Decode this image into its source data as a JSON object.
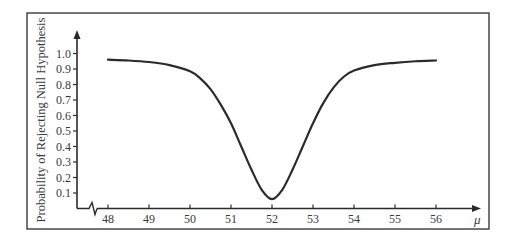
{
  "chart_data": {
    "type": "line",
    "title": "",
    "xlabel": "μ",
    "ylabel": "Probability of Rejecting Null Hypothesis",
    "x_ticks": [
      48,
      49,
      50,
      51,
      52,
      53,
      54,
      55,
      56
    ],
    "y_ticks": [
      0.1,
      0.2,
      0.3,
      0.4,
      0.5,
      0.6,
      0.7,
      0.8,
      0.9,
      1.0
    ],
    "y_tick_labels": [
      "0.1",
      "0.2",
      "0.3",
      "0.4",
      "0.5",
      "0.6",
      "0.7",
      "0.8",
      "0.9",
      "1.0"
    ],
    "x_tick_labels": [
      "48",
      "49",
      "50",
      "51",
      "52",
      "53",
      "54",
      "55",
      "56"
    ],
    "xlim": [
      47.25,
      57.0
    ],
    "ylim": [
      0,
      1.1
    ],
    "x_axis_break": true,
    "grid": false,
    "legend": "none",
    "series": [
      {
        "name": "Power curve",
        "x": [
          48,
          48.5,
          49,
          49.5,
          50,
          50.25,
          50.5,
          50.75,
          51,
          51.25,
          51.5,
          51.75,
          52,
          52.25,
          52.5,
          52.75,
          53,
          53.25,
          53.5,
          53.75,
          54,
          54.5,
          55,
          55.5,
          56
        ],
        "y": [
          0.96,
          0.955,
          0.945,
          0.925,
          0.885,
          0.84,
          0.77,
          0.67,
          0.55,
          0.4,
          0.25,
          0.12,
          0.06,
          0.12,
          0.25,
          0.4,
          0.55,
          0.68,
          0.78,
          0.85,
          0.89,
          0.925,
          0.94,
          0.95,
          0.955
        ]
      }
    ],
    "colors": {
      "line": "#2b2b2b",
      "axis": "#2b2b2b",
      "frame": "#3a3a3a"
    }
  }
}
